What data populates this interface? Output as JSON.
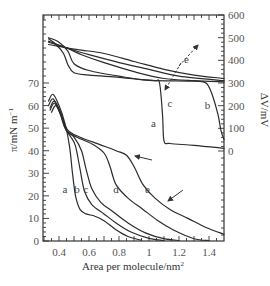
{
  "chart_data": {
    "type": "line",
    "title": "",
    "xlabel": "Area per molecule/nm²",
    "ylabel_left": "π/mN m⁻¹",
    "ylabel_right": "ΔV/mV",
    "xlim": [
      0.29,
      1.5
    ],
    "ylim_left": [
      0,
      70
    ],
    "ylim_right": [
      0,
      600
    ],
    "x_ticks": [
      "0.4",
      "0.6",
      "0.8",
      "1",
      "1.2",
      "1.4"
    ],
    "x_tick_values": [
      0.4,
      0.6,
      0.8,
      1.0,
      1.2,
      1.4
    ],
    "y_left_ticks": [
      "0",
      "10",
      "20",
      "30",
      "40",
      "50",
      "60",
      "70"
    ],
    "y_left_tick_values": [
      0,
      10,
      20,
      30,
      40,
      50,
      60,
      70
    ],
    "y_right_ticks": [
      "0",
      "100",
      "200",
      "300",
      "400",
      "500",
      "600"
    ],
    "y_right_tick_values": [
      0,
      100,
      200,
      300,
      400,
      500,
      600
    ],
    "grid": false,
    "legend": "none (curves labeled inline a–e)",
    "pi_A_isotherms": [
      {
        "name": "a",
        "points": [
          [
            0.33,
            62
          ],
          [
            0.36,
            65
          ],
          [
            0.4,
            60
          ],
          [
            0.44,
            52
          ],
          [
            0.47,
            42
          ],
          [
            0.49,
            30
          ],
          [
            0.51,
            20
          ],
          [
            0.54,
            14
          ],
          [
            0.58,
            12
          ],
          [
            0.64,
            11
          ],
          [
            0.7,
            9
          ],
          [
            0.78,
            5
          ],
          [
            0.86,
            2
          ],
          [
            0.95,
            0.3
          ]
        ]
      },
      {
        "name": "b",
        "points": [
          [
            0.33,
            60
          ],
          [
            0.36,
            63
          ],
          [
            0.4,
            58
          ],
          [
            0.44,
            50
          ],
          [
            0.48,
            46
          ],
          [
            0.51,
            42
          ],
          [
            0.54,
            32
          ],
          [
            0.57,
            22
          ],
          [
            0.62,
            16
          ],
          [
            0.7,
            12
          ],
          [
            0.78,
            8
          ],
          [
            0.88,
            4
          ],
          [
            1.0,
            1.2
          ],
          [
            1.1,
            0.2
          ]
        ]
      },
      {
        "name": "c",
        "points": [
          [
            0.34,
            59
          ],
          [
            0.37,
            62
          ],
          [
            0.41,
            57
          ],
          [
            0.45,
            49
          ],
          [
            0.5,
            46
          ],
          [
            0.55,
            40
          ],
          [
            0.58,
            32
          ],
          [
            0.62,
            23
          ],
          [
            0.68,
            17
          ],
          [
            0.76,
            13
          ],
          [
            0.86,
            8
          ],
          [
            0.98,
            3.5
          ],
          [
            1.1,
            1.0
          ],
          [
            1.2,
            0.2
          ]
        ]
      },
      {
        "name": "d",
        "points": [
          [
            0.34,
            58
          ],
          [
            0.37,
            61
          ],
          [
            0.41,
            56
          ],
          [
            0.45,
            49
          ],
          [
            0.52,
            46
          ],
          [
            0.62,
            43
          ],
          [
            0.7,
            39
          ],
          [
            0.74,
            33
          ],
          [
            0.78,
            25
          ],
          [
            0.86,
            19
          ],
          [
            0.96,
            14
          ],
          [
            1.06,
            9
          ],
          [
            1.16,
            5
          ],
          [
            1.3,
            1.0
          ],
          [
            1.4,
            0.2
          ]
        ]
      },
      {
        "name": "e",
        "points": [
          [
            0.35,
            57
          ],
          [
            0.38,
            60
          ],
          [
            0.42,
            55
          ],
          [
            0.46,
            49
          ],
          [
            0.54,
            46
          ],
          [
            0.66,
            43
          ],
          [
            0.78,
            40
          ],
          [
            0.85,
            38
          ],
          [
            0.9,
            33
          ],
          [
            0.96,
            25
          ],
          [
            1.04,
            19
          ],
          [
            1.14,
            14
          ],
          [
            1.26,
            10
          ],
          [
            1.38,
            6
          ],
          [
            1.5,
            3
          ]
        ]
      }
    ],
    "dV_A_isotherms": [
      {
        "name": "a",
        "points": [
          [
            0.33,
            495
          ],
          [
            0.38,
            470
          ],
          [
            0.43,
            430
          ],
          [
            0.46,
            380
          ],
          [
            0.5,
            345
          ],
          [
            0.6,
            335
          ],
          [
            0.8,
            325
          ],
          [
            0.95,
            315
          ],
          [
            1.04,
            310
          ],
          [
            1.07,
            300
          ],
          [
            1.09,
            160
          ],
          [
            1.1,
            45
          ],
          [
            1.14,
            33
          ],
          [
            1.3,
            25
          ],
          [
            1.5,
            12
          ]
        ]
      },
      {
        "name": "b",
        "points": [
          [
            0.33,
            500
          ],
          [
            0.4,
            480
          ],
          [
            0.46,
            440
          ],
          [
            0.5,
            385
          ],
          [
            0.6,
            355
          ],
          [
            0.8,
            330
          ],
          [
            1.0,
            312
          ],
          [
            1.3,
            308
          ],
          [
            1.38,
            300
          ],
          [
            1.42,
            250
          ],
          [
            1.46,
            160
          ],
          [
            1.48,
            90
          ],
          [
            1.5,
            50
          ]
        ]
      },
      {
        "name": "c",
        "points": [
          [
            0.33,
            485
          ],
          [
            0.45,
            455
          ],
          [
            0.55,
            425
          ],
          [
            0.7,
            390
          ],
          [
            0.9,
            350
          ],
          [
            1.1,
            320
          ],
          [
            1.3,
            310
          ],
          [
            1.5,
            305
          ]
        ]
      },
      {
        "name": "d",
        "points": [
          [
            0.33,
            480
          ],
          [
            0.45,
            455
          ],
          [
            0.52,
            440
          ],
          [
            0.6,
            425
          ],
          [
            0.8,
            390
          ],
          [
            1.0,
            360
          ],
          [
            1.2,
            330
          ],
          [
            1.5,
            310
          ]
        ]
      },
      {
        "name": "e",
        "points": [
          [
            0.33,
            470
          ],
          [
            0.45,
            455
          ],
          [
            0.55,
            445
          ],
          [
            0.7,
            430
          ],
          [
            0.9,
            395
          ],
          [
            1.1,
            360
          ],
          [
            1.3,
            335
          ],
          [
            1.5,
            320
          ]
        ]
      }
    ],
    "annotations": [
      {
        "text": "a",
        "target": "dV curve a",
        "x": 1.03,
        "dV": 125
      },
      {
        "text": "b",
        "target": "dV curve b",
        "x": 1.39,
        "dV": 205
      },
      {
        "text": "c",
        "target": "dashed arrow tail",
        "x": 1.14,
        "dV": 210
      },
      {
        "text": "e",
        "target": "dashed arrow head",
        "x": 1.25,
        "dV": 405
      },
      {
        "text": "a",
        "target": "π curve a",
        "x": 0.44,
        "pi": 23
      },
      {
        "text": "b",
        "target": "π curve b",
        "x": 0.52,
        "pi": 23
      },
      {
        "text": "c",
        "target": "π curve c",
        "x": 0.58,
        "pi": 23
      },
      {
        "text": "d",
        "target": "π curve d",
        "x": 0.78,
        "pi": 23
      },
      {
        "text": "e",
        "target": "π curve e",
        "x": 0.99,
        "pi": 23
      },
      {
        "text": "→ arrow",
        "target": "collapse kink of π curve e",
        "x": 0.9,
        "pi": 39
      },
      {
        "text": "→ arrow",
        "target": "π curve e tail",
        "x": 1.12,
        "pi": 17
      },
      {
        "text": "dashed double arrow c↔e",
        "target": "ΔV curves ordering c to e"
      }
    ]
  },
  "labels": {
    "xlabel": "Area per molecule/nm",
    "xlabel_sup": "2",
    "ylabel_left": "π/mN m",
    "ylabel_left_sup": "−1",
    "ylabel_right": "ΔV/mV"
  }
}
